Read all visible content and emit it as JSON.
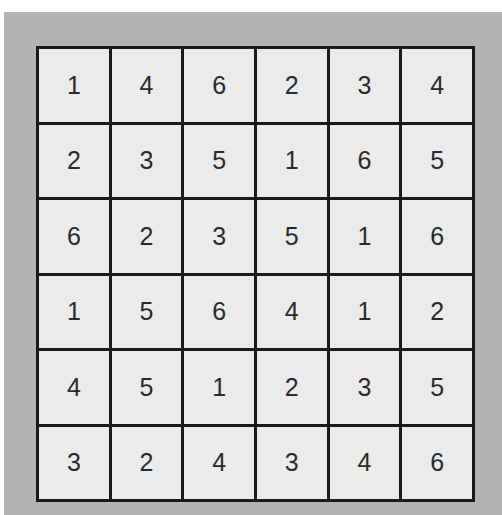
{
  "board": {
    "rows": 6,
    "cols": 6,
    "colors": {
      "frame": "#b3b3b3",
      "cell": "#ebebeb",
      "grid_line": "#1a1a1a",
      "digit": "#2a2a2a"
    },
    "cells": [
      [
        "1",
        "4",
        "6",
        "2",
        "3",
        "4"
      ],
      [
        "2",
        "3",
        "5",
        "1",
        "6",
        "5"
      ],
      [
        "6",
        "2",
        "3",
        "5",
        "1",
        "6"
      ],
      [
        "1",
        "5",
        "6",
        "4",
        "1",
        "2"
      ],
      [
        "4",
        "5",
        "1",
        "2",
        "3",
        "5"
      ],
      [
        "3",
        "2",
        "4",
        "3",
        "4",
        "6"
      ]
    ]
  }
}
